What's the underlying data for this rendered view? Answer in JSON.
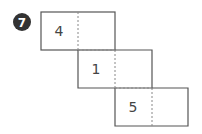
{
  "badge": {
    "label": "7",
    "color": "#333333"
  },
  "net": {
    "rows": [
      {
        "left_label": "4",
        "right_label": ""
      },
      {
        "left_label": "1",
        "right_label": ""
      },
      {
        "left_label": "5",
        "right_label": ""
      }
    ]
  }
}
